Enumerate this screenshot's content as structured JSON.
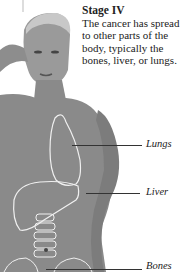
{
  "caption": {
    "title": "Stage IV",
    "body": "The cancer has spread to other parts of the body, typically the bones, liver, or lungs."
  },
  "labels": [
    {
      "text": "Lungs"
    },
    {
      "text": "Liver"
    },
    {
      "text": "Bones"
    }
  ],
  "colors": {
    "skin": "#8a8a8a",
    "organ_outline": "#f0f0f0",
    "background": "#ffffff"
  }
}
